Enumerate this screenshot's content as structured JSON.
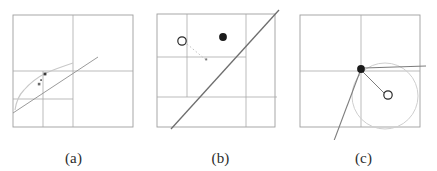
{
  "figure": {
    "background_color": "#ffffff",
    "width": 437,
    "height": 171,
    "panel_count": 3
  },
  "colors": {
    "grid_line": "#a9a9a9",
    "box_border": "#9e9e9e",
    "solid_line": "#6e6e6e",
    "curve_line": "#c0c0c0",
    "dotted_line": "#bdbdbd",
    "circle_outline": "#cfcfcf",
    "filled_dot": "#1a1a1a",
    "open_dot_stroke": "#2a2a2a",
    "open_dot_fill": "#ffffff",
    "caption_text": "#2b2b2b"
  },
  "panels": [
    {
      "id": "a",
      "caption": "(a)",
      "description": "Adaptive quadtree subdivision with curve and sample markers",
      "box": {
        "x": 13,
        "y": 15,
        "width": 120,
        "height": 112
      },
      "grid_lines": [
        {
          "name": "vertical-center",
          "x1": 73,
          "y1": 15,
          "x2": 73,
          "y2": 127
        },
        {
          "name": "horizontal-center",
          "x1": 13,
          "y1": 71,
          "x2": 133,
          "y2": 71
        },
        {
          "name": "horizontal-quarter-lower",
          "x1": 13,
          "y1": 99,
          "x2": 73,
          "y2": 99
        },
        {
          "name": "vertical-quarter-left",
          "x1": 43,
          "y1": 71,
          "x2": 43,
          "y2": 127
        }
      ],
      "curve": {
        "name": "light-curve",
        "points": [
          [
            15,
            110
          ],
          [
            18,
            99
          ],
          [
            24,
            90
          ],
          [
            33,
            81
          ],
          [
            44,
            74
          ],
          [
            56,
            69
          ],
          [
            66,
            65
          ],
          [
            73,
            63
          ]
        ]
      },
      "straight_line": {
        "x1": 13,
        "y1": 112,
        "x2": 97,
        "y2": 58
      },
      "markers": [
        {
          "name": "sample-marker-1",
          "x": 45,
          "y": 74,
          "size": 2.4
        },
        {
          "name": "sample-marker-2",
          "x": 41,
          "y": 80,
          "size": 1.8
        },
        {
          "name": "sample-marker-3",
          "x": 39,
          "y": 84,
          "size": 2.4
        }
      ]
    },
    {
      "id": "b",
      "caption": "(b)",
      "description": "Steep line crossing grid with open query point, dotted connector and filled intersection point",
      "box": {
        "x": 10,
        "y": 14,
        "width": 118,
        "height": 113
      },
      "grid_lines": [
        {
          "name": "vertical-left-quarter",
          "x1": 40,
          "y1": 14,
          "x2": 40,
          "y2": 97
        },
        {
          "name": "vertical-right-three-quarter",
          "x1": 99,
          "y1": 14,
          "x2": 99,
          "y2": 127
        },
        {
          "name": "horizontal-center",
          "x1": 10,
          "y1": 57,
          "x2": 99,
          "y2": 57
        },
        {
          "name": "horizontal-lower",
          "x1": 10,
          "y1": 97,
          "x2": 128,
          "y2": 97
        }
      ],
      "solid_line": {
        "x1": 24,
        "y1": 129,
        "x2": 131,
        "y2": 11
      },
      "open_circle": {
        "name": "query-point",
        "cx": 35,
        "cy": 41,
        "r": 4.2
      },
      "dotted_connector": {
        "x1": 39,
        "y1": 43,
        "x2": 58,
        "y2": 59
      },
      "connector_marker": {
        "name": "projection-marker",
        "x": 58,
        "y": 59,
        "size": 1.6
      },
      "filled_dot": {
        "name": "intersection-point",
        "cx": 76,
        "cy": 37,
        "r": 3.8
      }
    },
    {
      "id": "c",
      "caption": "(c)",
      "description": "Circle with center marker, radius line, tangent point on grid intersection and outgoing rays",
      "box": {
        "x": 10,
        "y": 15,
        "width": 120,
        "height": 112
      },
      "grid_lines": [
        {
          "name": "vertical-center",
          "x1": 71,
          "y1": 15,
          "x2": 71,
          "y2": 127
        },
        {
          "name": "horizontal-center",
          "x1": 10,
          "y1": 71,
          "x2": 130,
          "y2": 71
        }
      ],
      "big_circle": {
        "name": "search-radius-circle",
        "cx": 95,
        "cy": 96,
        "r": 33
      },
      "filled_dot": {
        "name": "contact-point",
        "cx": 71,
        "cy": 69,
        "r": 3.8
      },
      "open_circle": {
        "name": "circle-center",
        "cx": 98,
        "cy": 95,
        "r": 4.2
      },
      "radius_line": {
        "x1": 72,
        "y1": 71,
        "x2": 94,
        "y2": 93
      },
      "ray_down_left": {
        "x1": 71,
        "y1": 69,
        "x2": 42,
        "y2": 145
      },
      "ray_right": {
        "x1": 74,
        "y1": 68,
        "x2": 135,
        "y2": 66
      }
    }
  ]
}
